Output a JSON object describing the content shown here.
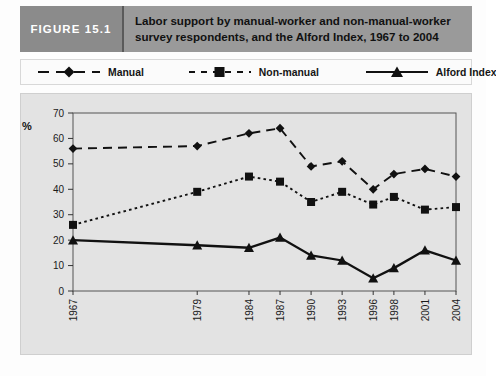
{
  "figure": {
    "tag": "FIGURE 15.1",
    "title_line1": "Labor support by manual-worker and non-manual-worker",
    "title_line2": "survey respondents, and the Alford Index, 1967 to 2004",
    "tag_bg": "#8b8b8b",
    "title_bg": "#9a9a9a",
    "title_color": "#111111",
    "tag_color": "#ffffff"
  },
  "legend": {
    "items": [
      {
        "label": "Manual",
        "marker": "diamond-marker",
        "line_style": "dashed-long"
      },
      {
        "label": "Non-manual",
        "marker": "square-marker",
        "line_style": "dashed-short"
      },
      {
        "label": "Alford Index",
        "marker": "triangle-marker",
        "line_style": "solid"
      }
    ]
  },
  "chart_data": {
    "type": "line",
    "title": "Labor support by manual-worker and non-manual-worker survey respondents, and the Alford Index, 1967 to 2004",
    "xlabel": "",
    "ylabel": "%",
    "categories": [
      "1967",
      "1979",
      "1984",
      "1987",
      "1990",
      "1993",
      "1996",
      "1998",
      "2001",
      "2004"
    ],
    "ylim": [
      0,
      70
    ],
    "yticks": [
      0,
      10,
      20,
      30,
      40,
      50,
      60,
      70
    ],
    "grid": false,
    "legend_position": "top-outside",
    "plot_bg": "#e3e3e3",
    "series": [
      {
        "name": "Manual",
        "marker": "diamond",
        "line_style": "dashed-long",
        "values": [
          56,
          57,
          62,
          64,
          49,
          51,
          40,
          46,
          48,
          45
        ]
      },
      {
        "name": "Non-manual",
        "marker": "square",
        "line_style": "dotted",
        "values": [
          26,
          39,
          45,
          43,
          35,
          39,
          34,
          37,
          32,
          33
        ]
      },
      {
        "name": "Alford Index",
        "marker": "triangle",
        "line_style": "solid",
        "values": [
          20,
          18,
          17,
          21,
          14,
          12,
          5,
          9,
          16,
          12
        ]
      }
    ]
  }
}
